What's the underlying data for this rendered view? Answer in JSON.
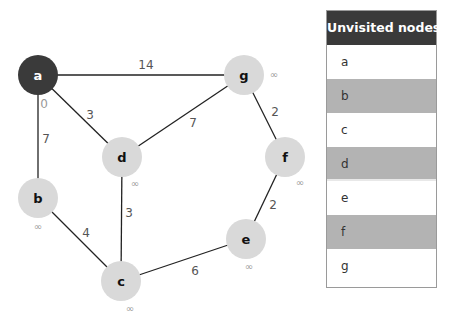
{
  "graph": {
    "nodes": [
      {
        "id": "a",
        "label": "a",
        "x": 38,
        "y": 75,
        "visited": true,
        "distance": "0",
        "dist_x": 44,
        "dist_y": 108
      },
      {
        "id": "g",
        "label": "g",
        "x": 244,
        "y": 75,
        "visited": false,
        "distance": "∞",
        "dist_x": 274,
        "dist_y": 78
      },
      {
        "id": "d",
        "label": "d",
        "x": 122,
        "y": 157,
        "visited": false,
        "distance": "∞",
        "dist_x": 135,
        "dist_y": 187
      },
      {
        "id": "f",
        "label": "f",
        "x": 285,
        "y": 157,
        "visited": false,
        "distance": "∞",
        "dist_x": 300,
        "dist_y": 186
      },
      {
        "id": "b",
        "label": "b",
        "x": 38,
        "y": 198,
        "visited": false,
        "distance": "∞",
        "dist_x": 38,
        "dist_y": 230
      },
      {
        "id": "e",
        "label": "e",
        "x": 246,
        "y": 239,
        "visited": false,
        "distance": "∞",
        "dist_x": 249,
        "dist_y": 270
      },
      {
        "id": "c",
        "label": "c",
        "x": 121,
        "y": 281,
        "visited": false,
        "distance": "∞",
        "dist_x": 130,
        "dist_y": 312
      }
    ],
    "edges": [
      {
        "from": "a",
        "to": "g",
        "weight": "14",
        "lx": 146,
        "ly": 69
      },
      {
        "from": "a",
        "to": "b",
        "weight": "7",
        "lx": 46,
        "ly": 143
      },
      {
        "from": "a",
        "to": "d",
        "weight": "3",
        "lx": 90,
        "ly": 119
      },
      {
        "from": "g",
        "to": "d",
        "weight": "7",
        "lx": 193,
        "ly": 127
      },
      {
        "from": "g",
        "to": "f",
        "weight": "2",
        "lx": 275,
        "ly": 116
      },
      {
        "from": "d",
        "to": "c",
        "weight": "3",
        "lx": 129,
        "ly": 217
      },
      {
        "from": "b",
        "to": "c",
        "weight": "4",
        "lx": 86,
        "ly": 237
      },
      {
        "from": "f",
        "to": "e",
        "weight": "2",
        "lx": 273,
        "ly": 209
      },
      {
        "from": "c",
        "to": "e",
        "weight": "6",
        "lx": 195,
        "ly": 275
      }
    ],
    "colors": {
      "visited_fill": "#3a3a3a",
      "unvisited_fill": "#d9d9d9",
      "edge": "#222222"
    }
  },
  "table": {
    "header": "Unvisited nodes",
    "rows": [
      {
        "label": "a",
        "shade": "white"
      },
      {
        "label": "b",
        "shade": "grey"
      },
      {
        "label": "c",
        "shade": "white"
      },
      {
        "label": "d",
        "shade": "grey"
      },
      {
        "label": "e",
        "shade": "white"
      },
      {
        "label": "f",
        "shade": "grey"
      },
      {
        "label": "g",
        "shade": "white"
      }
    ]
  }
}
